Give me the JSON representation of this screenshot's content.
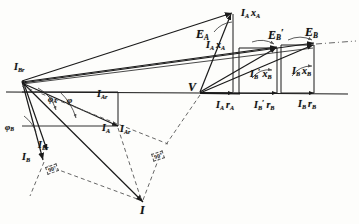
{
  "figure": {
    "kind": "hand-drawn phasor vector diagram",
    "background_color": "#fdfdfb",
    "ink_color": "#1a1a1a",
    "dashed_color": "#555555"
  },
  "vertices": {
    "origin_left": {
      "x": 22,
      "y": 80,
      "label": "I_B"
    },
    "center_V": {
      "x": 200,
      "y": 92,
      "label": "V"
    },
    "top_Ea": {
      "x": 233,
      "y": 12,
      "label": "E_A"
    },
    "right_Ebprime": {
      "x": 278,
      "y": 46,
      "label": "E'_B"
    },
    "right_Eb": {
      "x": 315,
      "y": 42,
      "label": "E_B"
    },
    "bottom_I": {
      "x": 144,
      "y": 208,
      "label": "I"
    }
  },
  "labels": {
    "E_A": {
      "base": "E",
      "sub": "A",
      "prime": false
    },
    "E_B_prime": {
      "base": "E",
      "sub": "B",
      "prime": true
    },
    "E_B": {
      "base": "E",
      "sub": "B",
      "prime": false
    },
    "V": {
      "base": "V"
    },
    "I": {
      "base": "I"
    },
    "I_Ax_A": {
      "text": "Iₐxₐ"
    },
    "I_Bx_B": {
      "text": "Iʙxʙ"
    },
    "I_Br_top": {
      "base": "I",
      "sub": "Br"
    },
    "I_Ar": {
      "base": "I",
      "sub": "Ar"
    },
    "I_A": {
      "base": "I",
      "sub": "A"
    },
    "I_ Br": {
      "base": "I",
      "sub": "Br"
    },
    "I_B": {
      "base": "I",
      "sub": "B"
    },
    "I_Brr": {
      "base": "I",
      "sub": "Brr"
    }
  },
  "text_labels": [
    {
      "name": "label-E-A",
      "x": 196,
      "y": 28,
      "size": "big",
      "main": "E",
      "sub": "A",
      "prime": "",
      "tail": ""
    },
    {
      "name": "label-E-B-prime",
      "x": 268,
      "y": 28,
      "size": "big",
      "main": "E",
      "sub": "B",
      "prime": "′",
      "tail": ""
    },
    {
      "name": "label-E-B",
      "x": 305,
      "y": 26,
      "size": "big",
      "main": "E",
      "sub": "B",
      "prime": "",
      "tail": ""
    },
    {
      "name": "label-V",
      "x": 188,
      "y": 81,
      "size": "big",
      "main": "V",
      "sub": "",
      "prime": "",
      "tail": ""
    },
    {
      "name": "label-I",
      "x": 140,
      "y": 204,
      "size": "big",
      "main": "I",
      "sub": "",
      "prime": "",
      "tail": ""
    },
    {
      "name": "label-IA-xA-top",
      "x": 241,
      "y": 8,
      "size": "med",
      "main": "I",
      "sub": "A",
      "prime": "",
      "tail": "x",
      "tail_sub": "A"
    },
    {
      "name": "label-IA-xA-mid",
      "x": 206,
      "y": 40,
      "size": "med",
      "main": "I",
      "sub": "A",
      "prime": "",
      "tail": "x",
      "tail_sub": "A"
    },
    {
      "name": "label-IBp-xB",
      "x": 250,
      "y": 68,
      "size": "med",
      "main": "I",
      "sub": "B",
      "prime": "′",
      "tail": "x",
      "tail_sub": "B"
    },
    {
      "name": "label-IB-xB",
      "x": 292,
      "y": 66,
      "size": "med",
      "main": "I",
      "sub": "B",
      "prime": "",
      "tail": "x",
      "tail_sub": "B"
    },
    {
      "name": "label-IA-rA",
      "x": 216,
      "y": 100,
      "size": "med",
      "main": "I",
      "sub": "A",
      "prime": "",
      "tail": "r",
      "tail_sub": "A"
    },
    {
      "name": "label-IBp-rB",
      "x": 254,
      "y": 99,
      "size": "med",
      "main": "I",
      "sub": "B",
      "prime": "′",
      "tail": "r",
      "tail_sub": "B"
    },
    {
      "name": "label-IB-rB",
      "x": 298,
      "y": 99,
      "size": "med",
      "main": "I",
      "sub": "B",
      "prime": "",
      "tail": "r",
      "tail_sub": "B"
    },
    {
      "name": "label-IB-left",
      "x": 14,
      "y": 62,
      "size": "med",
      "main": "I",
      "sub": "Br",
      "prime": "",
      "tail": ""
    },
    {
      "name": "label-IAr",
      "x": 97,
      "y": 89,
      "size": "med",
      "main": "I",
      "sub": "Ar",
      "prime": "",
      "tail": ""
    },
    {
      "name": "label-IA",
      "x": 102,
      "y": 123,
      "size": "med",
      "main": "I",
      "sub": "A",
      "prime": "",
      "tail": ""
    },
    {
      "name": "label-IAr2",
      "x": 120,
      "y": 124,
      "size": "med",
      "main": "I",
      "sub": "Ar",
      "prime": "",
      "tail": ""
    },
    {
      "name": "label-IBr",
      "x": 38,
      "y": 140,
      "size": "med",
      "main": "I",
      "sub": "Br",
      "prime": "",
      "tail": ""
    },
    {
      "name": "label-IB",
      "x": 22,
      "y": 152,
      "size": "med",
      "main": "I",
      "sub": "B",
      "prime": "",
      "tail": ""
    }
  ],
  "angles": [
    {
      "name": "angle-phi-A",
      "x": 48,
      "y": 95,
      "symbol": "φ",
      "sub": "A"
    },
    {
      "name": "angle-phi",
      "x": 67,
      "y": 96,
      "symbol": "φ",
      "sub": ""
    },
    {
      "name": "angle-phi-B",
      "x": 5,
      "y": 123,
      "symbol": "φ",
      "sub": "B"
    }
  ],
  "right_angle_markers": [
    {
      "name": "right-angle-marker-left",
      "x": 46,
      "y": 165,
      "text": "90°",
      "rotate": -20
    },
    {
      "name": "right-angle-marker-right",
      "x": 152,
      "y": 152,
      "text": "90°",
      "rotate": -18
    }
  ],
  "notes": {
    "horizontal_axis": "reference axis through left origin and V",
    "dashed_lines": "construction lines to right-angle markers and to I"
  }
}
